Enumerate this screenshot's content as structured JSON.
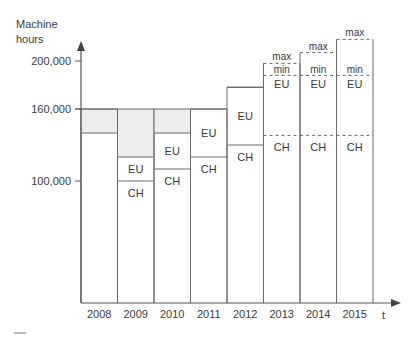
{
  "chart_data": {
    "type": "bar",
    "title": "",
    "ylabel": "Machine\nhours",
    "ylabel_lines": [
      "Machine",
      "hours"
    ],
    "xlabel": "t",
    "ylim": [
      0,
      230000
    ],
    "yticks": [
      {
        "value": 100000,
        "label": "100,000"
      },
      {
        "value": 160000,
        "label": "160,000"
      },
      {
        "value": 200000,
        "label": "200,000"
      }
    ],
    "capacity": 160000,
    "categories": [
      "2008",
      "2009",
      "2010",
      "2011",
      "2012",
      "2013",
      "2014",
      "2015"
    ],
    "series": [
      {
        "name": "CH",
        "values": [
          140000,
          100000,
          110000,
          120000,
          130000,
          138000,
          138000,
          138000
        ]
      },
      {
        "name": "EU",
        "values": [
          0,
          20000,
          30000,
          40000,
          48000,
          null,
          null,
          null
        ]
      },
      {
        "name": "EU min",
        "values": [
          null,
          null,
          null,
          null,
          null,
          188000,
          188000,
          188000
        ]
      },
      {
        "name": "EU max",
        "values": [
          null,
          null,
          null,
          null,
          null,
          198000,
          207000,
          218000
        ]
      },
      {
        "name": "Idle capacity",
        "values": [
          20000,
          40000,
          20000,
          0,
          0,
          0,
          0,
          0
        ]
      }
    ],
    "segment_labels": {
      "ch": "CH",
      "eu": "EU",
      "min": "min",
      "max": "max"
    },
    "colors": {
      "line": "#6a6a6a",
      "idle_fill": "#ededed",
      "text": "#3a3a3a"
    },
    "grid": false,
    "legend": "none"
  }
}
